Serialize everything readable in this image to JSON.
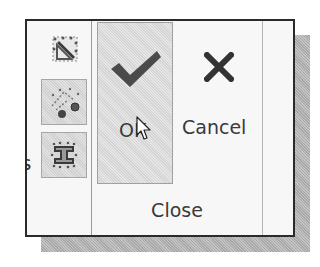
{
  "dialog": {
    "ok_label": "OK",
    "cancel_label": "Cancel",
    "group_label": "Close",
    "clipped_left_text": [
      "s",
      "r"
    ]
  },
  "icons": {
    "left_column": [
      "sketch-grid-diagonal-icon",
      "dimension-points-icon",
      "ibeam-profile-icon"
    ],
    "ok": "checkmark-icon",
    "cancel": "x-icon",
    "cursor": "mouse-pointer-icon"
  },
  "colors": {
    "frame_border": "#2a2a2a",
    "icon_dark": "#4a4a4a",
    "text": "#3a3a3a",
    "pressed_bg": "#dedede",
    "shadow": "#b8b8b8"
  }
}
